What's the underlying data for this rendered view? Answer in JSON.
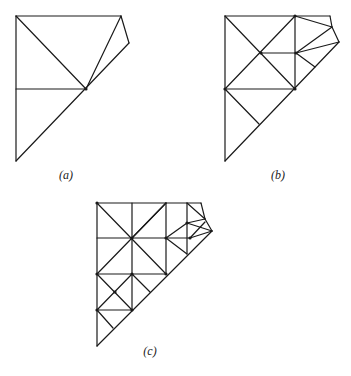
{
  "figure": {
    "panels": [
      {
        "id": "a",
        "label": "(a)",
        "label_x": 66,
        "label_y": 168
      },
      {
        "id": "b",
        "label": "(b)",
        "label_x": 278,
        "label_y": 168
      },
      {
        "id": "c",
        "label": "(c)",
        "label_x": 150,
        "label_y": 344
      }
    ],
    "stroke_color": "#1a1a1a",
    "background": "#ffffff"
  },
  "meshes": {
    "a": {
      "edges": [
        [
          16,
          16,
          121,
          16
        ],
        [
          121,
          16,
          129,
          43
        ],
        [
          129,
          43,
          16,
          161
        ],
        [
          16,
          161,
          16,
          16
        ],
        [
          16,
          16,
          86,
          89
        ],
        [
          16,
          89,
          86,
          89
        ],
        [
          86,
          89,
          121,
          16
        ]
      ],
      "nodes": [
        [
          86,
          89
        ]
      ]
    },
    "b": {
      "edges": [
        [
          225,
          16,
          330,
          16
        ],
        [
          330,
          16,
          332,
          27
        ],
        [
          332,
          27,
          339,
          42
        ],
        [
          339,
          42,
          225,
          161
        ],
        [
          225,
          161,
          225,
          16
        ],
        [
          225,
          16,
          295,
          89
        ],
        [
          295,
          16,
          225,
          89
        ],
        [
          295,
          16,
          295,
          89
        ],
        [
          261,
          53,
          296,
          53
        ],
        [
          225,
          89,
          295,
          89
        ],
        [
          225,
          89,
          259,
          124
        ],
        [
          295,
          16,
          332,
          27
        ],
        [
          296,
          53,
          332,
          27
        ],
        [
          296,
          53,
          339,
          42
        ],
        [
          296,
          53,
          315,
          67
        ]
      ],
      "nodes": [
        [
          261,
          53
        ],
        [
          296,
          53
        ],
        [
          225,
          89
        ],
        [
          295,
          89
        ],
        [
          295,
          16
        ]
      ]
    },
    "c": {
      "edges": [
        [
          97,
          203,
          201,
          203
        ],
        [
          201,
          203,
          205,
          219
        ],
        [
          205,
          219,
          212,
          231
        ],
        [
          212,
          231,
          97,
          346
        ],
        [
          97,
          346,
          97,
          203
        ],
        [
          132,
          203,
          132,
          310
        ],
        [
          166,
          203,
          166,
          274
        ],
        [
          187,
          203,
          187,
          254
        ],
        [
          97,
          238,
          190,
          238
        ],
        [
          97,
          274,
          166,
          274
        ],
        [
          97,
          310,
          132,
          310
        ],
        [
          97,
          203,
          166,
          274
        ],
        [
          166,
          203,
          97,
          274
        ],
        [
          132,
          238,
          166,
          203
        ],
        [
          166,
          238,
          187,
          254
        ],
        [
          97,
          274,
          132,
          310
        ],
        [
          132,
          274,
          97,
          310
        ],
        [
          132,
          274,
          150,
          292
        ],
        [
          97,
          310,
          113,
          328
        ],
        [
          187,
          203,
          205,
          219
        ],
        [
          187,
          223,
          205,
          219
        ],
        [
          187,
          223,
          212,
          231
        ],
        [
          190,
          238,
          212,
          231
        ],
        [
          190,
          238,
          205,
          222
        ],
        [
          166,
          238,
          187,
          223
        ]
      ],
      "nodes": [
        [
          97,
          203
        ],
        [
          132,
          238
        ],
        [
          166,
          238
        ],
        [
          190,
          238
        ],
        [
          187,
          223
        ],
        [
          97,
          274
        ],
        [
          132,
          274
        ],
        [
          166,
          274
        ],
        [
          115,
          292
        ],
        [
          97,
          310
        ],
        [
          132,
          310
        ]
      ]
    }
  }
}
